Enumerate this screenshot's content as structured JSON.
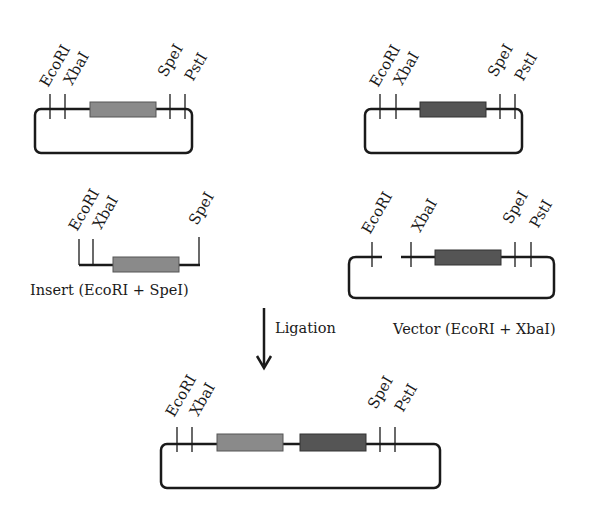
{
  "diagram": {
    "colors": {
      "line": "#1a1a1a",
      "insert_box": "#8a8a8a",
      "vector_box": "#555555"
    },
    "plasmid_insert": {
      "sites": [
        "EcoRI",
        "XbaI",
        "SpeI",
        "PstI"
      ]
    },
    "plasmid_vector": {
      "sites": [
        "EcoRI",
        "XbaI",
        "SpeI",
        "PstI"
      ]
    },
    "insert_fragment": {
      "sites": [
        "EcoRI",
        "XbaI",
        "SpeI"
      ],
      "caption": "Insert (EcoRI + SpeI)"
    },
    "cut_vector": {
      "sites": [
        "EcoRI",
        "XbaI",
        "SpeI",
        "PstI"
      ],
      "caption": "Vector (EcoRI + XbaI)"
    },
    "arrow": {
      "label": "Ligation"
    },
    "product": {
      "sites": [
        "EcoRI",
        "XbaI",
        "SpeI",
        "PstI"
      ]
    }
  }
}
